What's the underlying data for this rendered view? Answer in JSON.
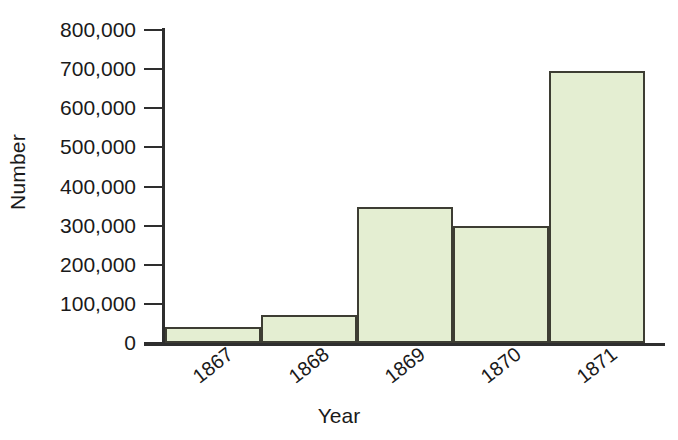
{
  "chart_data": {
    "type": "bar",
    "title": "",
    "xlabel": "Year",
    "ylabel": "Number",
    "categories": [
      "1867",
      "1868",
      "1869",
      "1870",
      "1871"
    ],
    "values": [
      40000,
      72000,
      348000,
      298000,
      695000
    ],
    "ylim": [
      0,
      800000
    ],
    "yticks": [
      0,
      100000,
      200000,
      300000,
      400000,
      500000,
      600000,
      700000,
      800000
    ],
    "ytick_labels": [
      "0",
      "100,000",
      "200,000",
      "300,000",
      "400,000",
      "500,000",
      "600,000",
      "700,000",
      "800,000"
    ],
    "xtick_labels": [
      "1867",
      "1868",
      "1869",
      "1870",
      "1871"
    ],
    "grid": false,
    "legend": null,
    "bar_fill_color": "#e4eed2",
    "bar_border_color": "#3d3d33",
    "axis_color": "#2e2e2e",
    "background_color": "#ffffff",
    "bar_style": "adjacent-histogram",
    "xtick_label_rotation": -38
  },
  "axes": {
    "y_title": "Number",
    "x_title": "Year"
  }
}
